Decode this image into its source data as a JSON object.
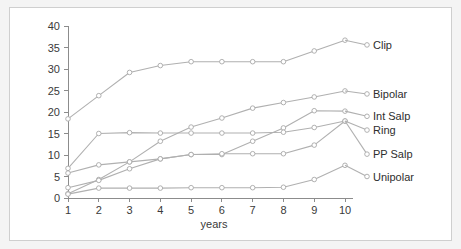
{
  "chart_data": {
    "type": "line",
    "title": "",
    "xlabel": "years",
    "ylabel": "",
    "x": [
      1,
      2,
      3,
      4,
      5,
      6,
      7,
      8,
      9,
      10
    ],
    "categories": [
      "1",
      "2",
      "3",
      "4",
      "5",
      "6",
      "7",
      "8",
      "9",
      "10"
    ],
    "xlim": [
      1,
      10
    ],
    "ylim": [
      0,
      40
    ],
    "yticks": [
      0,
      5,
      10,
      15,
      20,
      25,
      30,
      35,
      40
    ],
    "ytick_labels": [
      "0",
      "5",
      "10",
      "15",
      "20",
      "25",
      "30",
      "35",
      "40"
    ],
    "xticks": [
      1,
      2,
      3,
      4,
      5,
      6,
      7,
      8,
      9,
      10
    ],
    "xtick_labels": [
      "1",
      "2",
      "3",
      "4",
      "5",
      "6",
      "7",
      "8",
      "9",
      "10"
    ],
    "grid": false,
    "legend_position": "right-inline-labels",
    "marker": "open-circle",
    "line_color": "#b0b0b0",
    "marker_face_color": "#ffffff",
    "axis_color": "#8c8c8c",
    "background_color": "#ffffff",
    "figure_background_color": "#f4f4f4",
    "series": [
      {
        "name": "Clip",
        "values": [
          18.4,
          23.8,
          29.2,
          30.8,
          31.7,
          31.7,
          31.7,
          31.7,
          34.2,
          36.7
        ],
        "label_y_value": 35.6
      },
      {
        "name": "Bipolar",
        "values": [
          1.0,
          4.3,
          8.4,
          13.2,
          16.5,
          18.6,
          20.9,
          22.2,
          23.5,
          24.9
        ],
        "label_y_value": 24.2
      },
      {
        "name": "Int Salp",
        "values": [
          2.4,
          4.1,
          6.8,
          9.1,
          10.1,
          10.1,
          13.2,
          16.3,
          20.3,
          20.2
        ],
        "label_y_value": 19.0
      },
      {
        "name": "Ring",
        "values": [
          6.9,
          15.0,
          15.2,
          15.1,
          15.1,
          15.1,
          15.1,
          15.3,
          16.4,
          17.9
        ],
        "label_y_value": 15.8
      },
      {
        "name": "PP Salp",
        "values": [
          5.8,
          7.7,
          8.4,
          9.1,
          10.1,
          10.3,
          10.3,
          10.3,
          12.3,
          17.9
        ],
        "label_y_value": 10.2
      },
      {
        "name": "Unipolar",
        "values": [
          0.9,
          2.3,
          2.3,
          2.3,
          2.4,
          2.4,
          2.4,
          2.5,
          4.3,
          7.6
        ],
        "label_y_value": 5.0
      }
    ]
  }
}
